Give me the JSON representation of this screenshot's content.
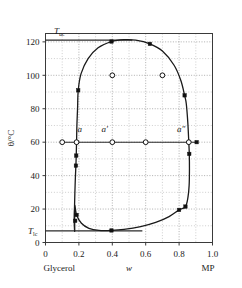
{
  "chart_data": {
    "type": "line",
    "title": "",
    "xlabel": "w",
    "ylabel": "θ/°C",
    "xlim": [
      0.0,
      1.0
    ],
    "ylim": [
      0,
      125
    ],
    "grid": true,
    "x_ticks": [
      "0",
      "0.2",
      "0.4",
      "0.6",
      "0.8",
      "1.0"
    ],
    "x_tick_values": [
      0.0,
      0.2,
      0.4,
      0.6,
      0.8,
      1.0
    ],
    "y_ticks": [
      "0",
      "20",
      "40",
      "60",
      "80",
      "100",
      "120"
    ],
    "y_tick_values": [
      0,
      20,
      40,
      60,
      80,
      100,
      120
    ],
    "x_axis_left_component": "Glycerol",
    "x_axis_right_component": "MP",
    "upper_critical_label": "T",
    "upper_critical_sub": "uc",
    "upper_critical_value": 121,
    "lower_critical_label": "T",
    "lower_critical_sub": "lc",
    "lower_critical_value": 7,
    "tie_line_temperature": 60,
    "legend": [],
    "series": [
      {
        "name": "closed-loop miscibility gap (binodal)",
        "style": "solid-curve",
        "points": [
          [
            0.175,
            7.0
          ],
          [
            0.172,
            12.0
          ],
          [
            0.172,
            16.5
          ],
          [
            0.174,
            22.0
          ],
          [
            0.176,
            30.0
          ],
          [
            0.179,
            39.0
          ],
          [
            0.182,
            46.0
          ],
          [
            0.184,
            52.0
          ],
          [
            0.186,
            60.0
          ],
          [
            0.188,
            70.0
          ],
          [
            0.192,
            80.0
          ],
          [
            0.196,
            91.0
          ],
          [
            0.213,
            101.0
          ],
          [
            0.255,
            110.0
          ],
          [
            0.315,
            116.5
          ],
          [
            0.395,
            120.2
          ],
          [
            0.47,
            121.3
          ],
          [
            0.54,
            121.0
          ],
          [
            0.625,
            118.8
          ],
          [
            0.7,
            114.5
          ],
          [
            0.77,
            106.0
          ],
          [
            0.81,
            97.0
          ],
          [
            0.833,
            88.0
          ],
          [
            0.843,
            83.0
          ],
          [
            0.852,
            72.0
          ],
          [
            0.858,
            60.0
          ],
          [
            0.861,
            53.0
          ],
          [
            0.862,
            44.0
          ],
          [
            0.86,
            34.0
          ],
          [
            0.853,
            27.0
          ],
          [
            0.838,
            21.5
          ],
          [
            0.8,
            19.5
          ],
          [
            0.74,
            15.5
          ],
          [
            0.66,
            12.0
          ],
          [
            0.57,
            9.5
          ],
          [
            0.47,
            7.8
          ],
          [
            0.395,
            7.2
          ],
          [
            0.32,
            7.2
          ],
          [
            0.26,
            8.5
          ],
          [
            0.215,
            11.5
          ],
          [
            0.186,
            16.5
          ],
          [
            0.175,
            22.0
          ]
        ]
      }
    ],
    "markers_filled": [
      {
        "x": 0.196,
        "y": 91.0
      },
      {
        "x": 0.395,
        "y": 120.2
      },
      {
        "x": 0.625,
        "y": 118.8
      },
      {
        "x": 0.833,
        "y": 88.0
      },
      {
        "x": 0.861,
        "y": 53.0
      },
      {
        "x": 0.838,
        "y": 21.5
      },
      {
        "x": 0.8,
        "y": 19.5
      },
      {
        "x": 0.395,
        "y": 7.2
      },
      {
        "x": 0.186,
        "y": 16.5
      },
      {
        "x": 0.178,
        "y": 13.0
      },
      {
        "x": 0.184,
        "y": 52.0
      },
      {
        "x": 0.182,
        "y": 46.0
      },
      {
        "x": 0.905,
        "y": 60.0
      }
    ],
    "markers_open": [
      {
        "x": 0.1,
        "y": 60.0,
        "label": ""
      },
      {
        "x": 0.186,
        "y": 60.0,
        "label": "a"
      },
      {
        "x": 0.4,
        "y": 60.0,
        "label": "a′"
      },
      {
        "x": 0.858,
        "y": 60.0,
        "label": "a″"
      },
      {
        "x": 0.7,
        "y": 100.0,
        "label": ""
      },
      {
        "x": 0.4,
        "y": 100.0,
        "label": ""
      },
      {
        "x": 0.6,
        "y": 60.0,
        "label": ""
      }
    ],
    "annotations": [
      {
        "text": "a",
        "x": 0.205,
        "y": 66.0,
        "italic": true
      },
      {
        "text": "a′",
        "x": 0.355,
        "y": 66.0,
        "italic": true
      },
      {
        "text": "a″",
        "x": 0.812,
        "y": 66.0,
        "italic": true
      }
    ]
  }
}
